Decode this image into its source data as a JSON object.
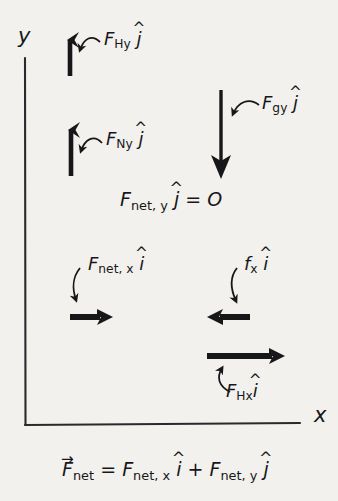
{
  "diagram": {
    "background_color": "#f2f1ee",
    "ink_color": "#17171a",
    "axes": {
      "y_label": "y",
      "x_label": "x",
      "origin_x": 25,
      "origin_y": 425
    },
    "forces": [
      {
        "id": "F_Hy",
        "label_base": "F",
        "label_sub": "Hy",
        "unit_vector": "j",
        "direction": "up",
        "arrow": {
          "x1": 70,
          "y1": 76,
          "x2": 70,
          "y2": 28
        },
        "label_pos": {
          "x": 104,
          "y": 30
        }
      },
      {
        "id": "F_Ny",
        "label_base": "F",
        "label_sub": "Ny",
        "unit_vector": "j",
        "direction": "up",
        "arrow": {
          "x1": 71,
          "y1": 176,
          "x2": 71,
          "y2": 118
        },
        "label_pos": {
          "x": 106,
          "y": 130
        }
      },
      {
        "id": "F_gy",
        "label_base": "F",
        "label_sub": "gy",
        "unit_vector": "j",
        "direction": "down",
        "arrow": {
          "x1": 221,
          "y1": 90,
          "x2": 221,
          "y2": 179
        },
        "label_pos": {
          "x": 262,
          "y": 94
        }
      },
      {
        "id": "F_net_x",
        "label_base": "F",
        "label_sub": "net, x",
        "unit_vector": "i",
        "direction": "right",
        "arrow": {
          "x1": 70,
          "y1": 317,
          "x2": 114,
          "y2": 317
        },
        "label_pos": {
          "x": 88,
          "y": 255
        }
      },
      {
        "id": "f_x",
        "label_base": "f",
        "label_sub": "x",
        "unit_vector": "i",
        "direction": "left",
        "arrow": {
          "x1": 250,
          "y1": 317,
          "x2": 206,
          "y2": 317
        },
        "label_pos": {
          "x": 244,
          "y": 255
        }
      },
      {
        "id": "F_Hx",
        "label_base": "F",
        "label_sub": "Hx",
        "unit_vector": "i",
        "direction": "right",
        "arrow": {
          "x1": 207,
          "y1": 356,
          "x2": 288,
          "y2": 356
        },
        "label_pos": {
          "x": 226,
          "y": 382
        }
      }
    ],
    "equations": {
      "y_equilibrium": {
        "base": "F",
        "sub": "net, y",
        "unit_vector": "j",
        "relation": "=",
        "value": "O",
        "pos": {
          "x": 120,
          "y": 190
        }
      },
      "net_force": {
        "lhs_base": "F",
        "lhs_sub": "net",
        "relation": "=",
        "term1_base": "F",
        "term1_sub": "net, x",
        "term1_unit": "i",
        "operator": "+",
        "term2_base": "F",
        "term2_sub": "net, y",
        "term2_unit": "j",
        "pos": {
          "x": 62,
          "y": 460
        }
      }
    }
  }
}
